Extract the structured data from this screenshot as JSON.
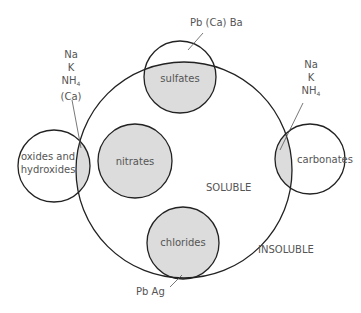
{
  "diagram": {
    "colors": {
      "stroke": "#222222",
      "fill": "#dcdcdc",
      "text": "#555555"
    },
    "regions": {
      "soluble": "SOLUBLE",
      "insoluble": "INSOLUBLE"
    },
    "circles": [
      {
        "id": "sulfates",
        "label": "sulfates"
      },
      {
        "id": "nitrates",
        "label": "nitrates"
      },
      {
        "id": "chlorides",
        "label": "chlorides"
      },
      {
        "id": "oxides",
        "label_line1": "oxides and",
        "label_line2": "hydroxides"
      },
      {
        "id": "carbonates",
        "label": "carbonates"
      }
    ],
    "annotations": {
      "sulfates_exceptions": "Pb (Ca) Ba",
      "chlorides_exceptions": "Pb Ag",
      "oxides_exceptions": [
        "Na",
        "K",
        "NH",
        "4",
        "(Ca)"
      ],
      "carbonates_exceptions": [
        "Na",
        "K",
        "NH",
        "4"
      ]
    }
  }
}
